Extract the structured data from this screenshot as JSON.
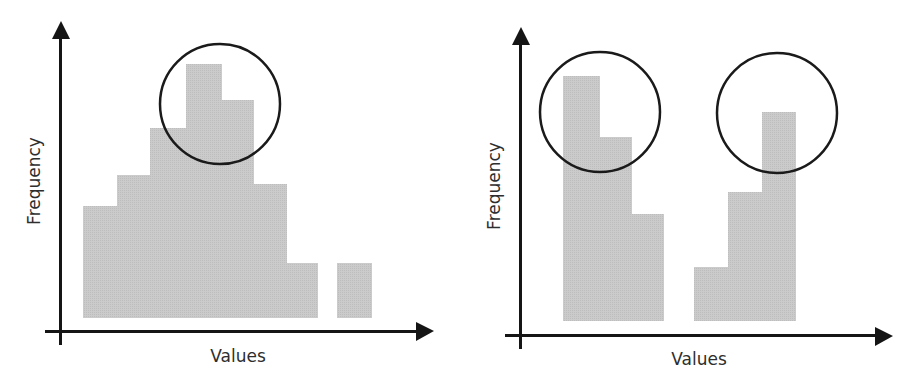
{
  "colors": {
    "bar_fill": "#c9c9c9",
    "axis": "#151515",
    "circle": "#1a1a1a",
    "text": "#2e2e2e",
    "background": "#ffffff"
  },
  "chart_data": [
    {
      "type": "bar",
      "subtype": "histogram",
      "title": "",
      "xlabel": "Values",
      "ylabel": "Frequency",
      "ticks": "none",
      "grid": false,
      "legend": null,
      "description": "Unimodal histogram with a single peak circled",
      "bins": [
        1,
        2,
        3,
        4,
        5,
        6,
        7,
        8,
        9
      ],
      "values": [
        4.8,
        5.9,
        7.6,
        9.9,
        8.6,
        5.6,
        2.3,
        0,
        2.3
      ],
      "annotations": [
        {
          "type": "circle",
          "label": "peak",
          "around_bins": [
            4,
            5
          ]
        }
      ]
    },
    {
      "type": "bar",
      "subtype": "histogram",
      "title": "",
      "xlabel": "Values",
      "ylabel": "Frequency",
      "ticks": "none",
      "grid": false,
      "legend": null,
      "description": "Bimodal histogram with two peaks circled",
      "bins": [
        1,
        2,
        3,
        4,
        5,
        6,
        7
      ],
      "values": [
        9.6,
        7.4,
        4.5,
        2.2,
        5.0,
        7.9,
        0
      ],
      "annotations": [
        {
          "type": "circle",
          "label": "peak-1",
          "around_bins": [
            1,
            2
          ]
        },
        {
          "type": "circle",
          "label": "peak-2",
          "around_bins": [
            6
          ]
        }
      ]
    }
  ],
  "charts": {
    "left": {
      "xlabel": "Values",
      "ylabel": "Frequency",
      "bars": [
        {
          "x": 83,
          "w": 34,
          "top": 206
        },
        {
          "x": 117,
          "w": 33,
          "top": 175
        },
        {
          "x": 150,
          "w": 36,
          "top": 128
        },
        {
          "x": 186,
          "w": 36,
          "top": 64
        },
        {
          "x": 222,
          "w": 32,
          "top": 100
        },
        {
          "x": 254,
          "w": 33,
          "top": 184
        },
        {
          "x": 287,
          "w": 31,
          "top": 263
        },
        {
          "x": 337,
          "w": 35,
          "top": 263
        }
      ],
      "bar_bottom": 318,
      "circles": [
        {
          "cx": 220,
          "cy": 104,
          "r": 60
        }
      ]
    },
    "right": {
      "xlabel": "Values",
      "ylabel": "Frequency",
      "bars": [
        {
          "x": 563,
          "w": 37,
          "top": 76
        },
        {
          "x": 600,
          "w": 32,
          "top": 137
        },
        {
          "x": 632,
          "w": 32,
          "top": 214
        },
        {
          "x": 694,
          "w": 34,
          "top": 267
        },
        {
          "x": 728,
          "w": 34,
          "top": 192
        },
        {
          "x": 762,
          "w": 34,
          "top": 112
        }
      ],
      "bar_bottom": 321,
      "circles": [
        {
          "cx": 600,
          "cy": 112,
          "r": 60
        },
        {
          "cx": 777,
          "cy": 113,
          "r": 60
        }
      ]
    }
  }
}
